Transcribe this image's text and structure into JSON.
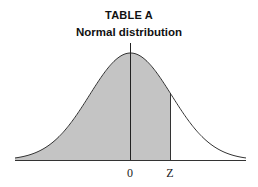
{
  "header": {
    "title": "TABLE A",
    "subtitle": "Normal distribution"
  },
  "chart_data": {
    "type": "area",
    "title": "TABLE A",
    "subtitle": "Normal distribution",
    "xlabel": "",
    "ylabel": "",
    "distribution": "standard normal",
    "x_tick_labels": [
      "0",
      "Z"
    ],
    "shaded_region": {
      "from": "-inf",
      "to": "Z",
      "description": "Area under curve left of Z"
    },
    "z_value_approx": 0.85,
    "grid": false,
    "legend": null,
    "colors": {
      "shade": "#c4c4c4",
      "curve": "#333333",
      "axis": "#333333"
    }
  }
}
